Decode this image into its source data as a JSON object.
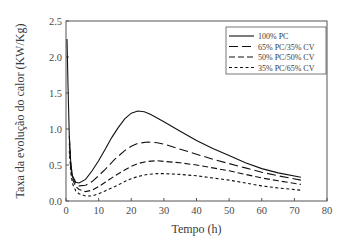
{
  "chart_data": {
    "type": "line",
    "title": "",
    "xlabel": "Tempo (h)",
    "ylabel": "Taxa da evolução do calor (KW/Kg)",
    "xlim": [
      0,
      80
    ],
    "ylim": [
      0,
      2.5
    ],
    "xticks": [
      "0",
      "10",
      "20",
      "30",
      "40",
      "50",
      "60",
      "70",
      "80"
    ],
    "yticks": [
      "0.0",
      "0.5",
      "1.0",
      "1.5",
      "2.0",
      "2.5"
    ],
    "grid": false,
    "legend_position": "upper right",
    "series": [
      {
        "name": "100% PC",
        "style": "solid",
        "x": [
          0.3,
          0.6,
          1,
          1.5,
          2,
          3,
          4,
          6,
          8,
          10,
          12,
          14,
          16,
          18,
          20,
          22,
          24,
          26,
          30,
          35,
          40,
          45,
          50,
          55,
          60,
          65,
          72
        ],
        "y": [
          2.25,
          1.6,
          0.9,
          0.5,
          0.35,
          0.26,
          0.25,
          0.3,
          0.42,
          0.56,
          0.72,
          0.88,
          1.02,
          1.14,
          1.22,
          1.25,
          1.24,
          1.2,
          1.1,
          0.97,
          0.84,
          0.73,
          0.63,
          0.53,
          0.45,
          0.39,
          0.33
        ]
      },
      {
        "name": "65% PC/35% CV",
        "style": "long-dash",
        "x": [
          1,
          1.5,
          2,
          3,
          4,
          6,
          8,
          10,
          12,
          15,
          18,
          20,
          22,
          25,
          28,
          30,
          35,
          40,
          45,
          50,
          55,
          60,
          65,
          72
        ],
        "y": [
          0.9,
          0.5,
          0.33,
          0.24,
          0.21,
          0.22,
          0.27,
          0.35,
          0.44,
          0.58,
          0.7,
          0.76,
          0.8,
          0.82,
          0.81,
          0.79,
          0.72,
          0.65,
          0.58,
          0.52,
          0.46,
          0.4,
          0.35,
          0.29
        ]
      },
      {
        "name": "50% PC/50% CV",
        "style": "dash",
        "x": [
          1,
          1.5,
          2,
          3,
          4,
          6,
          8,
          10,
          12,
          15,
          18,
          20,
          22,
          25,
          28,
          30,
          35,
          40,
          45,
          50,
          55,
          60,
          65,
          72
        ],
        "y": [
          0.8,
          0.45,
          0.3,
          0.2,
          0.16,
          0.13,
          0.15,
          0.2,
          0.26,
          0.35,
          0.43,
          0.48,
          0.52,
          0.55,
          0.56,
          0.55,
          0.53,
          0.5,
          0.46,
          0.42,
          0.37,
          0.32,
          0.28,
          0.23
        ]
      },
      {
        "name": "35% PC/65% CV",
        "style": "short-dash",
        "x": [
          1,
          1.5,
          2,
          3,
          4,
          6,
          8,
          10,
          12,
          15,
          18,
          20,
          22,
          25,
          28,
          30,
          35,
          40,
          45,
          50,
          55,
          60,
          65,
          72
        ],
        "y": [
          0.7,
          0.38,
          0.24,
          0.14,
          0.1,
          0.07,
          0.07,
          0.1,
          0.14,
          0.2,
          0.27,
          0.31,
          0.34,
          0.37,
          0.38,
          0.38,
          0.37,
          0.35,
          0.32,
          0.29,
          0.25,
          0.21,
          0.18,
          0.15
        ]
      }
    ]
  }
}
